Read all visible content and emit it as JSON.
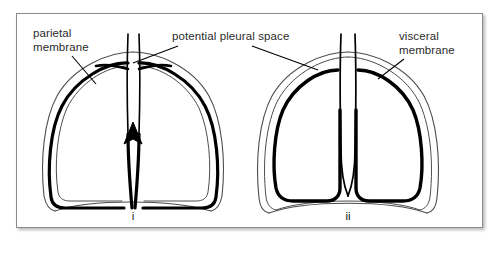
{
  "figure": {
    "frame_color": "#8a8a8a",
    "background": "#ffffff",
    "ink_color": "#000000",
    "thin_line_color": "#4d4d4d",
    "labels": {
      "parietal": {
        "line1": "parietal",
        "line2": "membrane"
      },
      "pleural_space": {
        "line1": "potential pleural space"
      },
      "visceral": {
        "line1": "visceral",
        "line2": "membrane"
      }
    },
    "panels": [
      {
        "id": "i",
        "caption": "i",
        "description": "Lungs fully inflated; visceral and parietal membranes in contact, pleural space is only potential"
      },
      {
        "id": "ii",
        "caption": "ii",
        "description": "Lungs partially collapsed; visceral and parietal membranes separated revealing the pleural space"
      }
    ]
  }
}
